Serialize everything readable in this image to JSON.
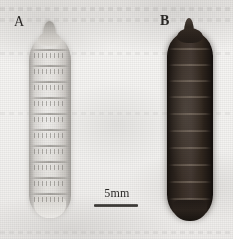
{
  "figure": {
    "type": "scanned-photographic-plate",
    "width": 233,
    "height": 239,
    "background_color": "#f2f1ef"
  },
  "panels": [
    {
      "letter": "A",
      "specimen_name": "pale-larva",
      "description": "light cream-gray segmented fly larva (maggot), anterior tapered at top",
      "color": "#dedbd6",
      "segment_count": 11
    },
    {
      "letter": "B",
      "specimen_name": "dark-puparium",
      "description": "dark brown-black segmented puparium, anterior tapered at top",
      "color": "#271f1a",
      "segment_count": 11
    }
  ],
  "scale_bar": {
    "label": "5mm",
    "bar_color": "#3b3937"
  }
}
